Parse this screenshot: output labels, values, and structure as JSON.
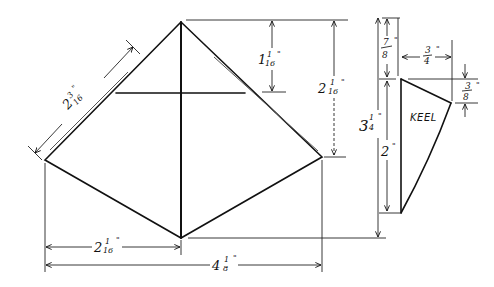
{
  "diagram": {
    "shape": {
      "diamond": {
        "top": [
          181,
          22
        ],
        "left": [
          45,
          160
        ],
        "right": [
          322,
          157
        ],
        "bottom": [
          181,
          238
        ],
        "crossbar_y": 93
      },
      "keel": {
        "label": "KEEL",
        "points": [
          [
            401,
            79
          ],
          [
            451,
            103
          ],
          [
            401,
            213
          ]
        ]
      }
    },
    "dimensions": {
      "edge_upper_left": {
        "whole": "2",
        "num": "3",
        "den": "16",
        "unit": "\""
      },
      "top_to_crossbar": {
        "whole": "1",
        "num": "1",
        "den": "16",
        "unit": "\""
      },
      "top_to_wingtip": {
        "whole": "2",
        "num": "1",
        "den": "16",
        "unit": "\""
      },
      "total_height": {
        "whole": "3",
        "num": "1",
        "den": "4",
        "unit": "\""
      },
      "keel_offset_top": {
        "whole": "",
        "num": "7",
        "den": "8",
        "unit": "\""
      },
      "keel_width": {
        "whole": "",
        "num": "3",
        "den": "4",
        "unit": "\""
      },
      "keel_corner_drop": {
        "whole": "",
        "num": "3",
        "den": "8",
        "unit": "\""
      },
      "keel_height": {
        "whole": "2",
        "num": "",
        "den": "",
        "unit": "\""
      },
      "half_width": {
        "whole": "2",
        "num": "1",
        "den": "16",
        "unit": "\""
      },
      "total_width": {
        "whole": "4",
        "num": "1",
        "den": "8",
        "unit": "\""
      }
    }
  }
}
